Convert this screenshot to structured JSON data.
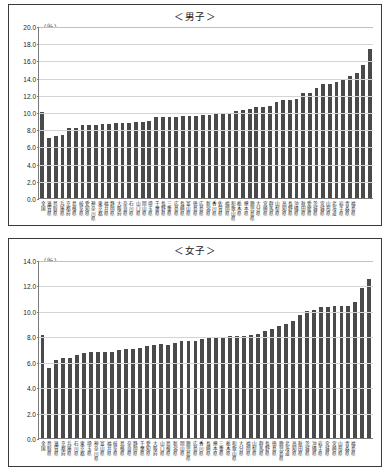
{
  "page": {
    "background": "#ffffff",
    "bar_color": "#4a4a4a",
    "grid_color": "#d4d4d4",
    "axis_color": "#7a7a7a",
    "border_color": "#3a3a3a"
  },
  "charts": [
    {
      "id": "boys",
      "title": "＜男子＞",
      "unit": "（％）"
    },
    {
      "id": "girls",
      "title": "＜女子＞",
      "unit": "（％）"
    }
  ],
  "chart_data": [
    {
      "type": "bar",
      "title": "＜男子＞",
      "xlabel": "",
      "ylabel": "（％）",
      "ylim": [
        0.0,
        20.0
      ],
      "yticks": [
        "0.0",
        "2.0",
        "4.0",
        "6.0",
        "8.0",
        "10.0",
        "12.0",
        "14.0",
        "16.0",
        "18.0",
        "20.0"
      ],
      "grid": true,
      "legend": "none",
      "categories": [
        "全国",
        "滋賀県",
        "鳥取県",
        "兵庫県",
        "京都府",
        "島根県",
        "岐阜県",
        "愛知県",
        "神奈川県",
        "東京都",
        "福井県",
        "静岡県",
        "大阪府",
        "奈良県",
        "石川県",
        "山口県",
        "岡山県",
        "埼玉県",
        "千葉県",
        "長野県",
        "三重県",
        "広島県",
        "長崎県",
        "富山県",
        "徳島県",
        "広島県",
        "新潟県",
        "香川県",
        "佐賀県",
        "福岡県",
        "和歌山県",
        "栃木県",
        "熊本県",
        "鹿児島県",
        "大分県",
        "宮崎県",
        "群馬県",
        "山梨県",
        "高知県",
        "長野県",
        "沖縄県",
        "秋田県",
        "愛媛県",
        "茨城県",
        "宮城県",
        "山形県",
        "北海道",
        "岩手県",
        "青森県",
        "福島県"
      ],
      "values": [
        10.0,
        7.0,
        7.2,
        7.3,
        8.1,
        8.1,
        8.5,
        8.5,
        8.5,
        8.6,
        8.6,
        8.7,
        8.7,
        8.7,
        8.8,
        8.8,
        9.0,
        9.4,
        9.4,
        9.4,
        9.4,
        9.5,
        9.5,
        9.5,
        9.6,
        9.7,
        9.8,
        9.8,
        9.8,
        10.1,
        10.2,
        10.3,
        10.6,
        10.6,
        10.7,
        11.2,
        11.4,
        11.4,
        11.5,
        12.2,
        12.2,
        12.8,
        13.3,
        13.3,
        13.5,
        13.8,
        14.2,
        14.5,
        15.5,
        17.3
      ]
    },
    {
      "type": "bar",
      "title": "＜女子＞",
      "xlabel": "",
      "ylabel": "（％）",
      "ylim": [
        0.0,
        14.0
      ],
      "yticks": [
        "0.0",
        "2.0",
        "4.0",
        "6.0",
        "8.0",
        "10.0",
        "12.0",
        "14.0"
      ],
      "grid": true,
      "legend": "none",
      "categories": [
        "全国",
        "鳥取県",
        "滋賀県",
        "京都府",
        "兵庫県",
        "石川県",
        "東京都",
        "埼玉県",
        "神奈川県",
        "富山県",
        "福井県",
        "岐阜県",
        "島根県",
        "奈良県",
        "静岡県",
        "千葉県",
        "愛知県",
        "大阪府",
        "山口県",
        "島根県",
        "新潟県",
        "岡山県",
        "鹿児島県",
        "広島県",
        "香川県",
        "長崎県",
        "熊本県",
        "三重県",
        "栃木県",
        "和歌山県",
        "大分県",
        "福岡県",
        "山梨県",
        "群馬県",
        "長野県",
        "徳島県",
        "鹿児島県",
        "北海道",
        "高知県",
        "秋田県",
        "茨城県",
        "沖縄県",
        "岩手県",
        "宮城県",
        "宮崎県",
        "山形県",
        "青森県",
        "福島県"
      ],
      "values": [
        8.1,
        5.5,
        6.1,
        6.3,
        6.3,
        6.5,
        6.7,
        6.8,
        6.8,
        6.8,
        6.8,
        6.9,
        7.0,
        7.0,
        7.1,
        7.2,
        7.3,
        7.4,
        7.3,
        7.5,
        7.6,
        7.6,
        7.6,
        7.8,
        7.9,
        7.9,
        7.9,
        8.0,
        8.0,
        8.0,
        8.1,
        8.2,
        8.4,
        8.6,
        8.8,
        9.0,
        9.2,
        9.7,
        10.0,
        10.1,
        10.3,
        10.3,
        10.4,
        10.4,
        10.4,
        10.7,
        11.8,
        12.5
      ]
    }
  ]
}
